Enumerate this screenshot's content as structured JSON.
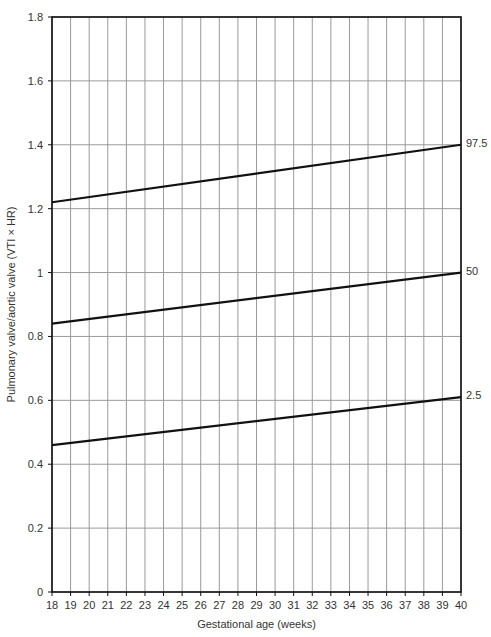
{
  "chart_data": {
    "type": "line",
    "title": "",
    "xlabel": "Gestational age (weeks)",
    "ylabel": "Pulmonary valve/aortic valve (VTI × HR)",
    "xlim": [
      18,
      40
    ],
    "ylim": [
      0,
      1.8
    ],
    "grid": true,
    "legend_position": "inline-right",
    "x_ticks": [
      18,
      19,
      20,
      21,
      22,
      23,
      24,
      25,
      26,
      27,
      28,
      29,
      30,
      31,
      32,
      33,
      34,
      35,
      36,
      37,
      38,
      39,
      40
    ],
    "y_ticks": [
      0,
      0.2,
      0.4,
      0.6,
      0.8,
      1,
      1.2,
      1.4,
      1.6,
      1.8
    ],
    "y_tick_labels": [
      "0",
      "0.2",
      "0.4",
      "0.6",
      "0.8",
      "1",
      "1.2",
      "1.4",
      "1.6",
      "1.8"
    ],
    "x": [
      18,
      40
    ],
    "series": [
      {
        "name": "97.5",
        "values": [
          1.22,
          1.4
        ]
      },
      {
        "name": "50",
        "values": [
          0.84,
          1.0
        ]
      },
      {
        "name": "2.5",
        "values": [
          0.46,
          0.61
        ]
      }
    ]
  },
  "colors": {
    "line": "#111111",
    "grid": "#9a9a9a",
    "axis": "#111111"
  }
}
